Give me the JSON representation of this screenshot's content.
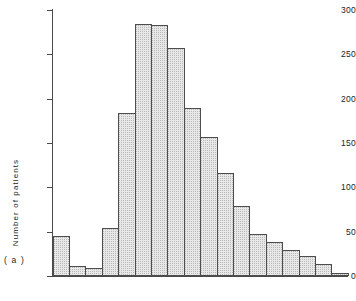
{
  "figure": {
    "panel_label": "( a )",
    "background_color": "#ffffff"
  },
  "axes": {
    "y_title": "Number of patients",
    "y_ticks": [
      0,
      50,
      100,
      150,
      200,
      250,
      300
    ],
    "y_tick_labels": [
      "0",
      "50",
      "100",
      "150",
      "200",
      "250",
      "300"
    ],
    "x_ticks": [],
    "x_tick_labels": [],
    "x_title": ""
  },
  "style": {
    "bar_fill": "#e8e8e8",
    "bar_stipple": "#b9b9b9",
    "bar_edge": "#4d4d4d",
    "axis_color": "#4a4a4a",
    "text_color": "#1c1c1c"
  },
  "chart_data": {
    "type": "bar",
    "title": "",
    "subtitle": "",
    "xlabel": "",
    "ylabel": "Number of patients",
    "annotations": [
      "( a )"
    ],
    "legend": [],
    "legend_position": "none",
    "grid": false,
    "ylim": [
      0,
      300
    ],
    "yticks": [
      0,
      50,
      100,
      150,
      200,
      250,
      300
    ],
    "xticks": [],
    "categories": [
      "1",
      "2",
      "3",
      "4",
      "5",
      "6",
      "7",
      "8",
      "9",
      "10",
      "11",
      "12",
      "13",
      "14",
      "15",
      "16",
      "17",
      "18"
    ],
    "values": [
      45,
      11,
      9,
      54,
      184,
      284,
      283,
      257,
      189,
      157,
      116,
      79,
      47,
      38,
      29,
      23,
      13,
      3
    ]
  }
}
